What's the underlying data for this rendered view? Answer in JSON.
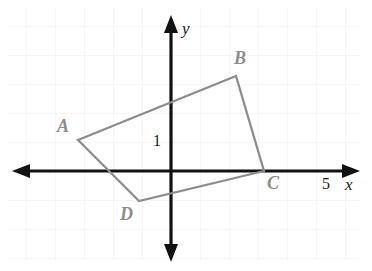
{
  "figure": {
    "background_color": "#ffffff",
    "grid_color": "#eceef2",
    "axis_color": "#111111",
    "shape_color": "#8d8d8d",
    "label_color": "#8d8d8d"
  },
  "axes": {
    "x_axis_label": "x",
    "y_axis_label": "y",
    "x_scale_tick_label": "5",
    "y_scale_tick_label": "1",
    "origin_px": {
      "x": 171,
      "y": 171
    },
    "grid_spacing_px": 29,
    "x_range": [
      -6,
      7
    ],
    "y_range": [
      -3,
      5
    ]
  },
  "chart_data": {
    "type": "scatter",
    "xlabel": "x",
    "ylabel": "y",
    "xlim": [
      -6,
      7
    ],
    "ylim": [
      -3.5,
      5
    ],
    "grid": true,
    "legend": "none",
    "annotations": [
      "1",
      "5"
    ],
    "series": [
      {
        "name": "Quadrilateral ABCD",
        "closed": true,
        "point_labels": [
          "A",
          "B",
          "C",
          "D"
        ],
        "x": [
          -3.2,
          2.25,
          3.2,
          -1.1
        ],
        "y": [
          1.05,
          3.3,
          0.0,
          -1.05
        ],
        "px": [
          {
            "x": 78,
            "y": 140
          },
          {
            "x": 236,
            "y": 76
          },
          {
            "x": 264,
            "y": 171
          },
          {
            "x": 139,
            "y": 201
          }
        ]
      }
    ]
  },
  "vertices": [
    {
      "id": "A",
      "label": "A",
      "px": {
        "x": 78,
        "y": 140
      },
      "label_px": {
        "x": 57,
        "y": 117
      }
    },
    {
      "id": "B",
      "label": "B",
      "px": {
        "x": 236,
        "y": 76
      },
      "label_px": {
        "x": 234,
        "y": 49
      }
    },
    {
      "id": "C",
      "label": "C",
      "px": {
        "x": 264,
        "y": 171
      },
      "label_px": {
        "x": 267,
        "y": 174
      }
    },
    {
      "id": "D",
      "label": "D",
      "px": {
        "x": 139,
        "y": 201
      },
      "label_px": {
        "x": 120,
        "y": 205
      }
    }
  ],
  "labels": {
    "unit_y": "1",
    "unit_x": "5",
    "axis_x": "x",
    "axis_y": "y"
  }
}
